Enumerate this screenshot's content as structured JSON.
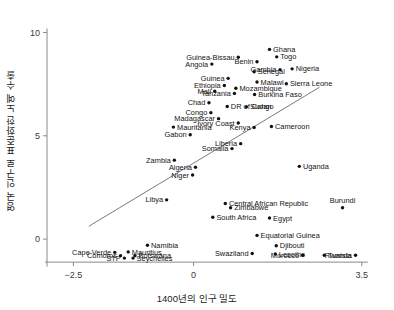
{
  "chart_data": {
    "type": "scatter",
    "title": "",
    "xlabel": "1400년의 인구 밀도",
    "ylabel": "영국 인구로 표준화한 노예 수출",
    "xlim": [
      -3.05,
      3.9
    ],
    "ylim": [
      -1.35,
      10.7
    ],
    "xticks": [
      -2.5,
      0,
      3.5
    ],
    "xticklabels": [
      "−2.5",
      "0",
      "3.5"
    ],
    "yticks": [
      0,
      5,
      10
    ],
    "yticklabels": [
      "0",
      "5",
      "10"
    ],
    "grid": false,
    "legend": null,
    "fit_line": {
      "label": "linear-fit",
      "x_start": -2.18,
      "y_start": 0.62,
      "x_end": 2.62,
      "y_end": 7.35
    },
    "points": [
      {
        "label": "Ghana",
        "x": 1.58,
        "y": 9.18,
        "label_pos": "right"
      },
      {
        "label": "Togo",
        "x": 1.73,
        "y": 8.82,
        "label_pos": "right"
      },
      {
        "label": "Guinea-Bissau",
        "x": 0.93,
        "y": 8.8,
        "label_pos": "left"
      },
      {
        "label": "Benin",
        "x": 1.32,
        "y": 8.58,
        "label_pos": "left"
      },
      {
        "label": "Angola",
        "x": 0.38,
        "y": 8.47,
        "label_pos": "left"
      },
      {
        "label": "Gambia",
        "x": 1.8,
        "y": 8.2,
        "label_pos": "left"
      },
      {
        "label": "Nigeria",
        "x": 2.05,
        "y": 8.24,
        "label_pos": "right"
      },
      {
        "label": "Senegal",
        "x": 1.26,
        "y": 8.1,
        "label_pos": "right"
      },
      {
        "label": "Guinea",
        "x": 0.72,
        "y": 7.78,
        "label_pos": "left"
      },
      {
        "label": "Malawi",
        "x": 1.32,
        "y": 7.6,
        "label_pos": "right"
      },
      {
        "label": "Sierra Leone",
        "x": 1.93,
        "y": 7.52,
        "label_pos": "right"
      },
      {
        "label": "Ethiopia",
        "x": 0.64,
        "y": 7.43,
        "label_pos": "left"
      },
      {
        "label": "Mozambique",
        "x": 0.88,
        "y": 7.3,
        "label_pos": "right"
      },
      {
        "label": "Mali",
        "x": 0.44,
        "y": 7.16,
        "label_pos": "left"
      },
      {
        "label": "Tanzania",
        "x": 0.85,
        "y": 7.05,
        "label_pos": "left"
      },
      {
        "label": "Burkina Faso",
        "x": 1.27,
        "y": 7.0,
        "label_pos": "right"
      },
      {
        "label": "Chad",
        "x": 0.32,
        "y": 6.6,
        "label_pos": "left"
      },
      {
        "label": "DR of Congo",
        "x": 0.7,
        "y": 6.42,
        "label_pos": "right"
      },
      {
        "label": "Sudan",
        "x": 1.1,
        "y": 6.4,
        "label_pos": "right"
      },
      {
        "label": "Congo",
        "x": 0.36,
        "y": 6.12,
        "label_pos": "left"
      },
      {
        "label": "Madagascar",
        "x": 0.52,
        "y": 5.83,
        "label_pos": "left"
      },
      {
        "label": "Ivory Coast",
        "x": 0.93,
        "y": 5.62,
        "label_pos": "left"
      },
      {
        "label": "Mauritania",
        "x": -0.42,
        "y": 5.42,
        "label_pos": "right"
      },
      {
        "label": "Kenya",
        "x": 1.26,
        "y": 5.4,
        "label_pos": "left"
      },
      {
        "label": "Cameroon",
        "x": 1.62,
        "y": 5.45,
        "label_pos": "right"
      },
      {
        "label": "Gabon",
        "x": -0.07,
        "y": 5.05,
        "label_pos": "left"
      },
      {
        "label": "Liberia",
        "x": 0.98,
        "y": 4.62,
        "label_pos": "left"
      },
      {
        "label": "Somalia",
        "x": 0.8,
        "y": 4.38,
        "label_pos": "left"
      },
      {
        "label": "Zambia",
        "x": -0.4,
        "y": 3.82,
        "label_pos": "left"
      },
      {
        "label": "Algeria",
        "x": 0.04,
        "y": 3.48,
        "label_pos": "left"
      },
      {
        "label": "Uganda",
        "x": 2.2,
        "y": 3.52,
        "label_pos": "right"
      },
      {
        "label": "Niger",
        "x": -0.02,
        "y": 3.1,
        "label_pos": "left"
      },
      {
        "label": "Libya",
        "x": -0.56,
        "y": 1.9,
        "label_pos": "left"
      },
      {
        "label": "Central African Republic",
        "x": 0.66,
        "y": 1.72,
        "label_pos": "right"
      },
      {
        "label": "Burundi",
        "x": 3.1,
        "y": 1.52,
        "label_pos": "above"
      },
      {
        "label": "Zimbabwe",
        "x": 0.77,
        "y": 1.52,
        "label_pos": "right"
      },
      {
        "label": "South Africa",
        "x": 0.4,
        "y": 1.06,
        "label_pos": "right"
      },
      {
        "label": "Egypt",
        "x": 1.58,
        "y": 1.02,
        "label_pos": "right"
      },
      {
        "label": "Equatorial Guinea",
        "x": 1.32,
        "y": 0.18,
        "label_pos": "right"
      },
      {
        "label": "Namibia",
        "x": -0.96,
        "y": -0.3,
        "label_pos": "right"
      },
      {
        "label": "Djibouti",
        "x": 1.72,
        "y": -0.32,
        "label_pos": "right"
      },
      {
        "label": "Swaziland",
        "x": 1.22,
        "y": -0.7,
        "label_pos": "left"
      },
      {
        "label": "Lesotho",
        "x": 1.7,
        "y": -0.72,
        "label_pos": "right"
      },
      {
        "label": "Morocco",
        "x": 2.27,
        "y": -0.78,
        "label_pos": "left"
      },
      {
        "label": "Tunisia",
        "x": 2.72,
        "y": -0.78,
        "label_pos": "right"
      },
      {
        "label": "Rwanda",
        "x": 3.37,
        "y": -0.78,
        "label_pos": "left"
      },
      {
        "label": "Cape Verde",
        "x": -1.64,
        "y": -0.64,
        "label_pos": "left"
      },
      {
        "label": "Mauritius",
        "x": -1.36,
        "y": -0.62,
        "label_pos": "right"
      },
      {
        "label": "Comoros",
        "x": -1.52,
        "y": -0.8,
        "label_pos": "left"
      },
      {
        "label": "Botswana",
        "x": -1.22,
        "y": -0.8,
        "label_pos": "right"
      },
      {
        "label": "STP",
        "x": -1.44,
        "y": -0.92,
        "label_pos": "left"
      },
      {
        "label": "Seychelles",
        "x": -1.26,
        "y": -0.92,
        "label_pos": "right"
      }
    ]
  }
}
